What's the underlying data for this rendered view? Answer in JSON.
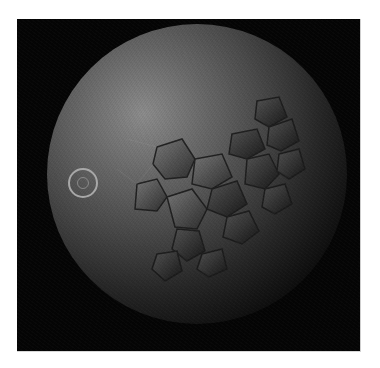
{
  "image": {
    "subject": "rendered sphere with voronoi cracked-cell surface",
    "background_color": "#050505",
    "sphere_highlight_color": "#8c8c8c",
    "marker": {
      "type": "double-circle",
      "color": "#a8a8a8"
    }
  }
}
